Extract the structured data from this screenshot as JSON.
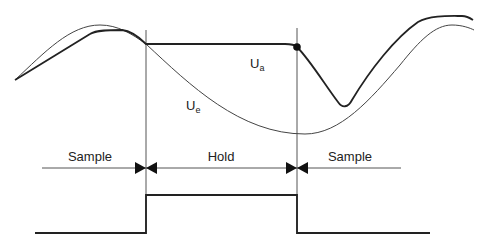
{
  "labels": {
    "ua_main": "U",
    "ua_sub": "a",
    "ue_main": "U",
    "ue_sub": "e",
    "sample_left": "Sample",
    "hold": "Hold",
    "sample_right": "Sample"
  },
  "colors": {
    "line": "#222222",
    "thin_line": "#333333",
    "background": "#ffffff"
  }
}
